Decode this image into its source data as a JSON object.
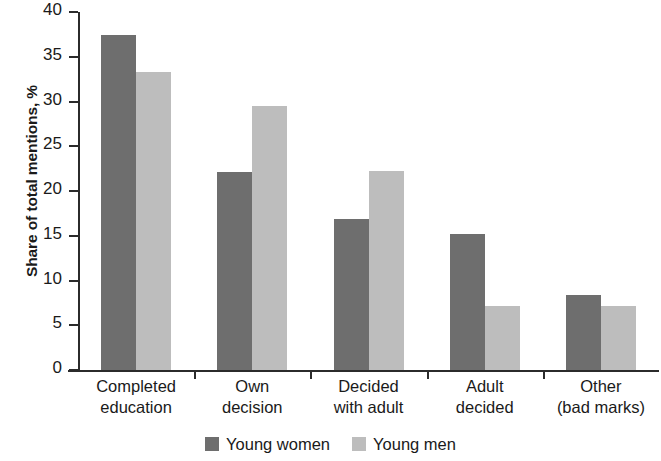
{
  "chart_data": {
    "type": "bar",
    "title": "",
    "subtitle": "",
    "xlabel": "",
    "ylabel": "Share of total mentions, %",
    "ylim": [
      0,
      40
    ],
    "yticks": [
      0,
      5,
      10,
      15,
      20,
      25,
      30,
      35,
      40
    ],
    "ytick_labels": [
      "0",
      "5",
      "10",
      "15",
      "20",
      "25",
      "30",
      "35",
      "40"
    ],
    "grid": false,
    "legend_position": "bottom-center",
    "categories": [
      "Completed education",
      "Own decision",
      "Decided with adult",
      "Adult decided",
      "Other (bad marks)"
    ],
    "category_lines": [
      [
        "Completed",
        "education"
      ],
      [
        "Own",
        "decision"
      ],
      [
        "Decided",
        "with adult"
      ],
      [
        "Adult",
        "decided"
      ],
      [
        "Other",
        "(bad marks)"
      ]
    ],
    "series": [
      {
        "name": "Young women",
        "color": "#6e6e6e",
        "values": [
          37.4,
          22.1,
          16.9,
          15.2,
          8.4
        ]
      },
      {
        "name": "Young men",
        "color": "#bdbdbd",
        "values": [
          33.3,
          29.5,
          22.2,
          7.2,
          7.2
        ]
      }
    ]
  },
  "colors": {
    "series_women": "#6e6e6e",
    "series_men": "#bdbdbd",
    "axis": "#2b2b2b",
    "text": "#1a1a1a",
    "background": "#ffffff"
  }
}
